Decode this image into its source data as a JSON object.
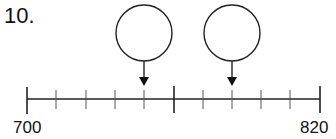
{
  "question_number": "10.",
  "number_line": {
    "start_label": "700",
    "end_label": "820",
    "start_value": 700,
    "end_value": 820,
    "intervals": 10,
    "major_tick_values": [
      700,
      760,
      820
    ],
    "answer_boxes": [
      {
        "points_to_tick": 4,
        "answer": ""
      },
      {
        "points_to_tick": 7,
        "answer": ""
      }
    ]
  }
}
